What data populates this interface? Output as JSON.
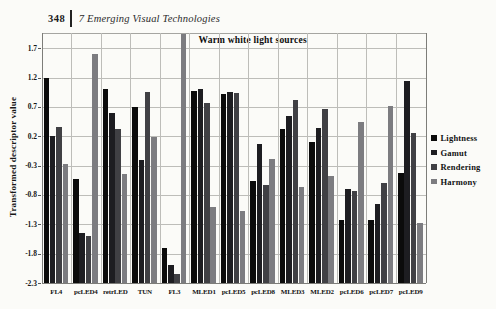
{
  "page": {
    "header": {
      "page_number": "348",
      "chapter_title": "7 Emerging Visual Technologies"
    }
  },
  "chart_data": {
    "type": "bar",
    "title": "Warm white light sources",
    "ylabel": "Transformed descriptor value",
    "categories": [
      "FL4",
      "pcLED4",
      "retrLED",
      "TUN",
      "FL3",
      "MLED1",
      "pcLED5",
      "pcLED8",
      "MLED3",
      "MLED2",
      "pcLED6",
      "pcLED7",
      "pcLED9"
    ],
    "series": [
      {
        "name": "Lightness",
        "color": "#0b0b0b",
        "values": [
          1.2,
          -0.52,
          1.0,
          0.7,
          -1.7,
          0.97,
          0.92,
          -0.57,
          0.33,
          0.1,
          -1.22,
          -1.22,
          -0.42
        ]
      },
      {
        "name": "Gamut",
        "color": "#1d1d21",
        "values": [
          0.2,
          -1.45,
          0.6,
          -0.2,
          -2.0,
          1.0,
          0.96,
          0.07,
          0.55,
          0.34,
          -0.7,
          -0.95,
          1.15
        ]
      },
      {
        "name": "Rendering",
        "color": "#404044",
        "values": [
          0.35,
          -1.5,
          0.32,
          0.95,
          -2.15,
          0.76,
          0.93,
          -0.63,
          0.82,
          0.66,
          -0.73,
          -0.6,
          0.25
        ]
      },
      {
        "name": "Harmony",
        "color": "#7c7c80",
        "values": [
          -0.27,
          1.6,
          -0.45,
          0.18,
          1.95,
          -1.0,
          -1.08,
          -0.19,
          -0.66,
          -0.47,
          0.45,
          0.72,
          -1.27
        ]
      }
    ],
    "yticks": [
      1.7,
      1.2,
      0.7,
      0.2,
      -0.3,
      -0.8,
      -1.3,
      -1.8,
      -2.3
    ],
    "ylim": [
      -2.3,
      1.96
    ],
    "bar_baseline": -2.3,
    "grid": "both",
    "legend_position": "right"
  }
}
